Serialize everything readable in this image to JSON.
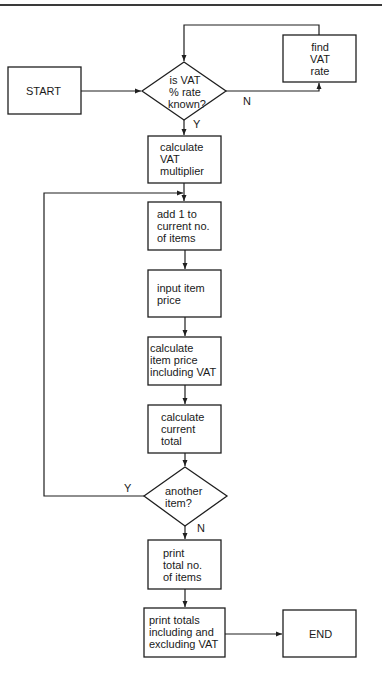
{
  "diagram": {
    "type": "flowchart",
    "nodes": {
      "start": {
        "kind": "terminal",
        "lines": [
          "START"
        ]
      },
      "vat_known": {
        "kind": "decision",
        "lines": [
          "is VAT",
          "% rate",
          "known?"
        ]
      },
      "find_vat": {
        "kind": "process",
        "lines": [
          "find",
          "VAT",
          "rate"
        ]
      },
      "calc_multiplier": {
        "kind": "process",
        "lines": [
          "calculate",
          "VAT",
          "multiplier"
        ]
      },
      "add_one": {
        "kind": "process",
        "lines": [
          "add 1 to",
          "current no.",
          "of items"
        ]
      },
      "input_price": {
        "kind": "process",
        "lines": [
          "input item",
          "price"
        ]
      },
      "calc_item_price": {
        "kind": "process",
        "lines": [
          "calculate",
          "item price",
          "including VAT"
        ]
      },
      "calc_total": {
        "kind": "process",
        "lines": [
          "calculate",
          "current",
          "total"
        ]
      },
      "another_item": {
        "kind": "decision",
        "lines": [
          "another",
          "item?"
        ]
      },
      "print_count": {
        "kind": "process",
        "lines": [
          "print",
          "total no.",
          "of items"
        ]
      },
      "print_totals": {
        "kind": "process",
        "lines": [
          "print totals",
          "including and",
          "excluding VAT"
        ]
      },
      "end": {
        "kind": "terminal",
        "lines": [
          "END"
        ]
      }
    },
    "edge_labels": {
      "vat_known_no": "N",
      "vat_known_yes": "Y",
      "another_item_yes": "Y",
      "another_item_no": "N"
    },
    "edges": [
      {
        "from": "start",
        "to": "vat_known"
      },
      {
        "from": "vat_known",
        "to": "find_vat",
        "label": "N"
      },
      {
        "from": "find_vat",
        "to": "vat_known"
      },
      {
        "from": "vat_known",
        "to": "calc_multiplier",
        "label": "Y"
      },
      {
        "from": "calc_multiplier",
        "to": "add_one"
      },
      {
        "from": "add_one",
        "to": "input_price"
      },
      {
        "from": "input_price",
        "to": "calc_item_price"
      },
      {
        "from": "calc_item_price",
        "to": "calc_total"
      },
      {
        "from": "calc_total",
        "to": "another_item"
      },
      {
        "from": "another_item",
        "to": "add_one",
        "label": "Y"
      },
      {
        "from": "another_item",
        "to": "print_count",
        "label": "N"
      },
      {
        "from": "print_count",
        "to": "print_totals"
      },
      {
        "from": "print_totals",
        "to": "end"
      }
    ]
  }
}
